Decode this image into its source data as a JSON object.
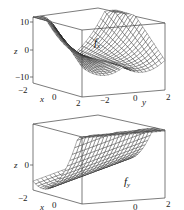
{
  "chart_data": [
    {
      "type": "surface3d",
      "title": "",
      "surface_label": "f_x",
      "surface_label_main": "f",
      "surface_label_sub": "x",
      "xlabel": "x",
      "ylabel": "y",
      "zlabel": "z",
      "xlim": [
        -2,
        2
      ],
      "ylim": [
        -2,
        2
      ],
      "zlim": [
        -10,
        10
      ],
      "x_ticks": [
        "-2",
        "0",
        "2"
      ],
      "y_ticks": [
        "-2",
        "0",
        "2"
      ],
      "z_ticks": [
        "10",
        "0",
        "-10"
      ],
      "style": "wireframe",
      "description": "Saddle-like surface; z ≈ 10 at y=±2 back edges, dipping to about -10 near x=2 front corners"
    },
    {
      "type": "surface3d",
      "title": "",
      "surface_label": "f_y",
      "surface_label_main": "f",
      "surface_label_sub": "y",
      "xlabel": "x",
      "ylabel": "y",
      "zlabel": "z",
      "xlim": [
        -2,
        2
      ],
      "ylim": [
        -2,
        2
      ],
      "zlim": null,
      "x_ticks": [
        "-2",
        "0"
      ],
      "y_ticks": [
        "0",
        "2"
      ],
      "z_ticks": [
        "0"
      ],
      "style": "wireframe",
      "description": "Parabolic trough (half-pipe) surface running along the y direction"
    }
  ],
  "plots": [
    {
      "id": "fx",
      "z_axis_title": "z",
      "z_ticks": [
        {
          "label": "10",
          "y": 23
        },
        {
          "label": "0",
          "y": 51
        },
        {
          "label": "−10",
          "y": 78
        }
      ],
      "bottom_labels": [
        {
          "text": "−2",
          "x": 18,
          "y": 93
        },
        {
          "text": "x",
          "x": 40,
          "y": 102,
          "italic": true
        },
        {
          "text": "0",
          "x": 52,
          "y": 100
        },
        {
          "text": "2",
          "x": 76,
          "y": 106
        },
        {
          "text": "−2",
          "x": 100,
          "y": 103
        },
        {
          "text": "0",
          "x": 133,
          "y": 101
        },
        {
          "text": "y",
          "x": 142,
          "y": 105,
          "italic": true
        },
        {
          "text": "2",
          "x": 166,
          "y": 100
        }
      ]
    },
    {
      "id": "fy",
      "z_axis_title": "z",
      "z_ticks": [
        {
          "label": "0",
          "y": 165
        }
      ],
      "bottom_labels": [
        {
          "text": "−2",
          "x": 18,
          "y": 201
        },
        {
          "text": "x",
          "x": 40,
          "y": 210,
          "italic": true
        },
        {
          "text": "0",
          "x": 52,
          "y": 208
        },
        {
          "text": "0",
          "x": 133,
          "y": 210
        },
        {
          "text": "2",
          "x": 166,
          "y": 207
        }
      ]
    }
  ]
}
